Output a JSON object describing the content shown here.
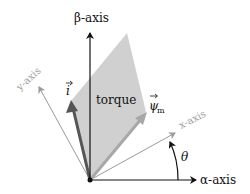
{
  "diagram": {
    "type": "vector-diagram",
    "labels": {
      "beta_axis": "β-axis",
      "alpha_axis": "α-axis",
      "x_axis": "x-axis",
      "y_axis": "y-axis",
      "current_vector": "i",
      "flux_vector": "ψ",
      "flux_subscript": "m",
      "torque_area": "torque",
      "angle": "θ"
    },
    "colors": {
      "axis": "#111111",
      "rotated_axis": "#9a9a9a",
      "torque_fill": "#cfcfcf",
      "current_vector": "#555555",
      "flux_vector": "#a8a8a8",
      "label_gray": "#a0a0a0"
    }
  }
}
